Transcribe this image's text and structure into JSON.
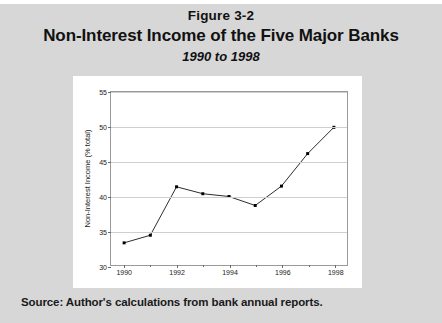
{
  "figure": {
    "number": "Figure 3-2",
    "title": "Non-Interest Income of the Five Major Banks",
    "subtitle": "1990 to 1998",
    "source": "Source: Author's calculations from bank annual reports."
  },
  "colors": {
    "page_background": "#d7d7d7",
    "panel_background": "#ffffff",
    "line": "#2b2b2b",
    "marker": "#000000",
    "gridline": "#cfcfcf",
    "axis": "#9a9a9a"
  },
  "chart_data": {
    "type": "line",
    "title": "Non-Interest Income of the Five Major Banks",
    "subtitle": "1990 to 1998",
    "xlabel": "",
    "ylabel": "Non-Interest Income (% total)",
    "x": [
      1990,
      1991,
      1992,
      1993,
      1994,
      1995,
      1996,
      1997,
      1998
    ],
    "values": [
      33.2,
      34.3,
      41.3,
      40.3,
      39.9,
      38.6,
      41.4,
      46.1,
      49.9
    ],
    "series": [
      {
        "name": "Non-Interest Income (% total)",
        "values": [
          33.2,
          34.3,
          41.3,
          40.3,
          39.9,
          38.6,
          41.4,
          46.1,
          49.9
        ]
      }
    ],
    "xlim": [
      1989.5,
      1998.5
    ],
    "ylim": [
      30,
      55
    ],
    "yticks": [
      30,
      35,
      40,
      45,
      50,
      55
    ],
    "ytick_labels": [
      "30",
      "35",
      "40",
      "45",
      "50",
      "55"
    ],
    "xticks": [
      1990,
      1991,
      1992,
      1993,
      1994,
      1995,
      1996,
      1997,
      1998
    ],
    "xtick_labels_major": [
      "1990",
      "1992",
      "1994",
      "1996",
      "1998"
    ],
    "xtick_major_values": [
      1990,
      1992,
      1994,
      1996,
      1998
    ],
    "grid": true,
    "grid_axis": "y",
    "legend": false,
    "marker": "square",
    "marker_size": 3
  }
}
